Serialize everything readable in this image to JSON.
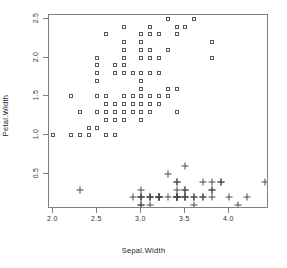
{
  "chart_data": {
    "type": "scatter",
    "title": "",
    "xlabel": "Sepal.Width",
    "ylabel": "Petal.Width",
    "xlim": [
      1.95,
      4.45
    ],
    "ylim": [
      0.05,
      2.55
    ],
    "xticks": [
      2.0,
      2.5,
      3.0,
      3.5,
      4.0
    ],
    "xticklabels": [
      "2.0",
      "2.5",
      "3.0",
      "3.5",
      "4.0"
    ],
    "yticks": [
      0.5,
      1.0,
      1.5,
      2.0,
      2.5
    ],
    "yticklabels": [
      "0.5",
      "1.0",
      "1.5",
      "2.0",
      "2.5"
    ],
    "grid": false,
    "legend": "none",
    "marker_color": "#4a4a4a",
    "box_color": "#808080",
    "series": [
      {
        "name": "square-group",
        "marker": "open-square",
        "points": [
          [
            3.2,
            1.4
          ],
          [
            3.2,
            1.5
          ],
          [
            3.1,
            1.5
          ],
          [
            2.3,
            1.3
          ],
          [
            2.8,
            1.5
          ],
          [
            2.8,
            1.3
          ],
          [
            3.3,
            1.6
          ],
          [
            2.4,
            1.0
          ],
          [
            2.9,
            1.3
          ],
          [
            2.7,
            1.4
          ],
          [
            2.0,
            1.0
          ],
          [
            3.0,
            1.5
          ],
          [
            2.2,
            1.0
          ],
          [
            2.9,
            1.4
          ],
          [
            2.9,
            1.3
          ],
          [
            3.1,
            1.4
          ],
          [
            3.0,
            1.5
          ],
          [
            2.7,
            1.0
          ],
          [
            2.2,
            1.5
          ],
          [
            2.5,
            1.1
          ],
          [
            3.2,
            1.8
          ],
          [
            2.8,
            1.3
          ],
          [
            2.5,
            1.5
          ],
          [
            2.8,
            1.2
          ],
          [
            2.9,
            1.3
          ],
          [
            3.0,
            1.4
          ],
          [
            2.8,
            1.4
          ],
          [
            3.0,
            1.7
          ],
          [
            2.9,
            1.5
          ],
          [
            2.6,
            1.0
          ],
          [
            2.4,
            1.1
          ],
          [
            2.4,
            1.0
          ],
          [
            2.7,
            1.2
          ],
          [
            2.7,
            1.3
          ],
          [
            3.0,
            1.2
          ],
          [
            3.4,
            1.3
          ],
          [
            3.1,
            1.3
          ],
          [
            2.3,
            1.3
          ],
          [
            3.0,
            1.3
          ],
          [
            2.5,
            1.1
          ],
          [
            2.6,
            1.2
          ],
          [
            3.0,
            1.4
          ],
          [
            2.6,
            1.2
          ],
          [
            2.3,
            1.0
          ],
          [
            2.7,
            1.3
          ],
          [
            3.0,
            1.2
          ],
          [
            2.9,
            1.3
          ],
          [
            2.9,
            1.3
          ],
          [
            2.5,
            1.1
          ],
          [
            2.8,
            1.3
          ],
          [
            3.3,
            2.5
          ],
          [
            2.7,
            1.9
          ],
          [
            3.0,
            2.1
          ],
          [
            2.9,
            1.8
          ],
          [
            3.0,
            2.2
          ],
          [
            3.0,
            2.1
          ],
          [
            2.5,
            1.7
          ],
          [
            2.9,
            1.8
          ],
          [
            2.5,
            1.8
          ],
          [
            3.6,
            2.5
          ],
          [
            3.2,
            2.0
          ],
          [
            2.7,
            1.9
          ],
          [
            3.0,
            2.1
          ],
          [
            2.5,
            2.0
          ],
          [
            2.8,
            2.4
          ],
          [
            3.2,
            2.3
          ],
          [
            3.0,
            1.8
          ],
          [
            3.8,
            2.2
          ],
          [
            2.6,
            2.3
          ],
          [
            2.2,
            1.5
          ],
          [
            3.2,
            2.3
          ],
          [
            2.8,
            2.0
          ],
          [
            2.8,
            2.0
          ],
          [
            2.7,
            1.8
          ],
          [
            3.3,
            2.1
          ],
          [
            3.2,
            1.8
          ],
          [
            2.8,
            1.8
          ],
          [
            3.0,
            1.8
          ],
          [
            2.8,
            2.1
          ],
          [
            3.0,
            1.6
          ],
          [
            2.8,
            1.9
          ],
          [
            3.8,
            2.0
          ],
          [
            2.8,
            2.2
          ],
          [
            2.8,
            1.5
          ],
          [
            2.6,
            1.4
          ],
          [
            3.0,
            2.3
          ],
          [
            3.4,
            2.4
          ],
          [
            3.1,
            1.8
          ],
          [
            3.0,
            1.8
          ],
          [
            3.1,
            2.1
          ],
          [
            3.1,
            2.4
          ],
          [
            3.1,
            2.3
          ],
          [
            2.7,
            1.9
          ],
          [
            3.2,
            2.3
          ],
          [
            3.3,
            2.5
          ],
          [
            3.0,
            2.3
          ],
          [
            2.5,
            1.9
          ],
          [
            3.0,
            2.0
          ],
          [
            3.4,
            2.3
          ],
          [
            3.0,
            1.8
          ],
          [
            3.4,
            1.6
          ],
          [
            3.5,
            2.4
          ],
          [
            3.4,
            2.3
          ],
          [
            3.1,
            2.0
          ],
          [
            3.2,
            1.5
          ],
          [
            3.3,
            1.5
          ],
          [
            3.0,
            1.4
          ],
          [
            3.1,
            1.5
          ],
          [
            2.9,
            1.4
          ],
          [
            3.1,
            1.4
          ],
          [
            2.8,
            1.4
          ],
          [
            2.8,
            1.5
          ],
          [
            3.2,
            1.4
          ],
          [
            3.0,
            1.3
          ],
          [
            2.7,
            1.4
          ],
          [
            3.0,
            1.6
          ],
          [
            2.6,
            1.3
          ],
          [
            2.5,
            1.3
          ],
          [
            2.6,
            1.5
          ],
          [
            2.6,
            1.4
          ]
        ]
      },
      {
        "name": "plus-group",
        "marker": "plus",
        "points": [
          [
            3.5,
            0.2
          ],
          [
            3.0,
            0.2
          ],
          [
            3.2,
            0.2
          ],
          [
            3.1,
            0.2
          ],
          [
            3.6,
            0.2
          ],
          [
            3.9,
            0.4
          ],
          [
            3.4,
            0.3
          ],
          [
            3.4,
            0.2
          ],
          [
            2.9,
            0.2
          ],
          [
            3.1,
            0.1
          ],
          [
            3.7,
            0.2
          ],
          [
            3.4,
            0.2
          ],
          [
            3.0,
            0.1
          ],
          [
            3.0,
            0.1
          ],
          [
            4.0,
            0.2
          ],
          [
            4.4,
            0.4
          ],
          [
            3.9,
            0.4
          ],
          [
            3.5,
            0.3
          ],
          [
            3.8,
            0.3
          ],
          [
            3.8,
            0.3
          ],
          [
            3.4,
            0.2
          ],
          [
            3.7,
            0.4
          ],
          [
            3.6,
            0.2
          ],
          [
            3.3,
            0.5
          ],
          [
            3.4,
            0.2
          ],
          [
            3.0,
            0.2
          ],
          [
            3.4,
            0.4
          ],
          [
            3.5,
            0.2
          ],
          [
            3.4,
            0.2
          ],
          [
            3.2,
            0.2
          ],
          [
            3.1,
            0.2
          ],
          [
            3.4,
            0.4
          ],
          [
            4.1,
            0.1
          ],
          [
            4.2,
            0.2
          ],
          [
            3.1,
            0.2
          ],
          [
            3.2,
            0.2
          ],
          [
            3.5,
            0.2
          ],
          [
            3.6,
            0.1
          ],
          [
            3.0,
            0.2
          ],
          [
            3.4,
            0.2
          ],
          [
            3.5,
            0.3
          ],
          [
            2.3,
            0.3
          ],
          [
            3.2,
            0.2
          ],
          [
            3.5,
            0.6
          ],
          [
            3.8,
            0.4
          ],
          [
            3.0,
            0.3
          ],
          [
            3.8,
            0.2
          ],
          [
            3.2,
            0.2
          ],
          [
            3.7,
            0.2
          ],
          [
            3.3,
            0.2
          ]
        ]
      }
    ]
  }
}
